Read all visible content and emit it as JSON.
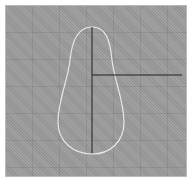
{
  "canvas": {
    "background": "#9c9c9c",
    "grid_spacing_px": 27
  },
  "shape": {
    "type": "teardrop-outline",
    "stroke": "#e8e8e8"
  },
  "crosshair": {
    "color": "#202020",
    "vertical": {
      "x": 92,
      "y1": 27,
      "y2": 153
    },
    "horizontal": {
      "y": 75,
      "x1": 92,
      "x2": 182
    }
  }
}
